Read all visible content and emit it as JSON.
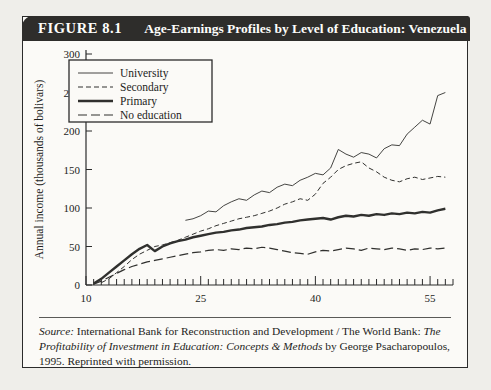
{
  "figure": {
    "number": "FIGURE 8.1",
    "title": "Age-Earnings Profiles by Level of Education: Venezuela"
  },
  "source": {
    "label": "Source:",
    "text_part1": " International Bank for Reconstruction and Development / The World Bank: ",
    "italic_part": "The Profitability of Investment in Education: Concepts & Methods",
    "text_part2": " by George Psacharopoulos, 1995. Reprinted with permission."
  },
  "chart_data": {
    "type": "line",
    "title": "Age-Earnings Profiles by Level of Education: Venezuela",
    "xlabel": "Age",
    "ylabel": "Annual income (thousands of bolivars)",
    "xlim": [
      10,
      58
    ],
    "ylim": [
      0,
      300
    ],
    "xticks": [
      10,
      25,
      40,
      55
    ],
    "yticks": [
      0,
      50,
      100,
      150,
      200,
      250,
      300
    ],
    "grid": false,
    "legend_position": "top-left",
    "series": [
      {
        "name": "University",
        "style": "thin-solid",
        "x": [
          23,
          24,
          25,
          26,
          27,
          28,
          29,
          30,
          31,
          32,
          33,
          34,
          35,
          36,
          37,
          38,
          39,
          40,
          41,
          42,
          43,
          44,
          45,
          46,
          47,
          48,
          49,
          50,
          51,
          52,
          53,
          54,
          55,
          56,
          57
        ],
        "y": [
          84,
          86,
          90,
          96,
          95,
          103,
          108,
          112,
          110,
          117,
          122,
          120,
          127,
          131,
          129,
          136,
          140,
          145,
          143,
          152,
          176,
          170,
          166,
          172,
          170,
          165,
          177,
          182,
          181,
          196,
          205,
          214,
          209,
          246,
          250
        ]
      },
      {
        "name": "Secondary",
        "style": "short-dash",
        "x": [
          12,
          13,
          14,
          15,
          16,
          17,
          18,
          19,
          20,
          21,
          22,
          23,
          24,
          25,
          26,
          27,
          28,
          29,
          30,
          31,
          32,
          33,
          34,
          35,
          36,
          37,
          38,
          39,
          40,
          41,
          42,
          43,
          44,
          45,
          46,
          47,
          48,
          49,
          50,
          51,
          52,
          53,
          54,
          55,
          56,
          57
        ],
        "y": [
          3,
          8,
          16,
          24,
          33,
          40,
          45,
          50,
          52,
          55,
          58,
          62,
          66,
          70,
          73,
          77,
          80,
          83,
          86,
          88,
          90,
          93,
          96,
          100,
          105,
          108,
          112,
          110,
          118,
          132,
          140,
          150,
          155,
          158,
          160,
          152,
          147,
          140,
          136,
          134,
          138,
          140,
          137,
          139,
          141,
          140
        ]
      },
      {
        "name": "Primary",
        "style": "thick-solid",
        "x": [
          11,
          12,
          13,
          14,
          15,
          16,
          17,
          18,
          19,
          20,
          21,
          22,
          23,
          24,
          25,
          26,
          27,
          28,
          29,
          30,
          31,
          32,
          33,
          34,
          35,
          36,
          37,
          38,
          39,
          40,
          41,
          42,
          43,
          44,
          45,
          46,
          47,
          48,
          49,
          50,
          51,
          52,
          53,
          54,
          55,
          56,
          57
        ],
        "y": [
          2,
          8,
          16,
          24,
          32,
          40,
          47,
          52,
          44,
          50,
          54,
          57,
          59,
          62,
          64,
          66,
          68,
          69,
          71,
          72,
          74,
          75,
          76,
          78,
          79,
          81,
          82,
          84,
          85,
          86,
          87,
          85,
          88,
          90,
          89,
          91,
          90,
          92,
          91,
          93,
          92,
          94,
          93,
          95,
          94,
          97,
          99
        ]
      },
      {
        "name": "No education",
        "style": "long-dash",
        "x": [
          11,
          12,
          13,
          14,
          15,
          16,
          17,
          18,
          19,
          20,
          21,
          22,
          23,
          24,
          25,
          26,
          27,
          28,
          29,
          30,
          31,
          32,
          33,
          34,
          35,
          36,
          37,
          38,
          39,
          40,
          41,
          42,
          43,
          44,
          45,
          46,
          47,
          48,
          49,
          50,
          51,
          52,
          53,
          54,
          55,
          56,
          57
        ],
        "y": [
          1,
          5,
          10,
          15,
          20,
          24,
          27,
          30,
          32,
          34,
          36,
          38,
          40,
          42,
          43,
          45,
          46,
          45,
          47,
          46,
          48,
          47,
          49,
          48,
          46,
          44,
          42,
          41,
          40,
          43,
          45,
          44,
          46,
          48,
          47,
          45,
          48,
          47,
          46,
          48,
          47,
          45,
          47,
          46,
          48,
          47,
          48
        ]
      }
    ]
  }
}
